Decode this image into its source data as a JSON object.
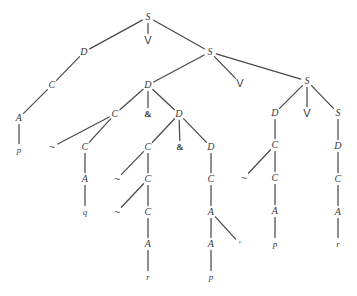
{
  "figure": {
    "kind": "syntax-tree",
    "width": 357,
    "height": 296,
    "background": "#ffffff",
    "stroke_color": "#4a4a4a",
    "text_color": "#3a3a3a"
  },
  "nodes": [
    {
      "id": "n0",
      "label": "S",
      "x": 148,
      "y": 17,
      "class": ""
    },
    {
      "id": "n1",
      "label": "D",
      "x": 84,
      "y": 52,
      "class": ""
    },
    {
      "id": "n2",
      "label": "V",
      "x": 148,
      "y": 40,
      "class": "conn"
    },
    {
      "id": "n3",
      "label": "S",
      "x": 210,
      "y": 52,
      "class": ""
    },
    {
      "id": "n4",
      "label": "C",
      "x": 52,
      "y": 85,
      "class": ""
    },
    {
      "id": "n5",
      "label": "A",
      "x": 19,
      "y": 118,
      "class": ""
    },
    {
      "id": "n6",
      "label": "p",
      "x": 19,
      "y": 150,
      "class": "terminal"
    },
    {
      "id": "n7",
      "label": "D",
      "x": 148,
      "y": 85,
      "class": ""
    },
    {
      "id": "n8",
      "label": "V",
      "x": 240,
      "y": 83,
      "class": "conn"
    },
    {
      "id": "n9",
      "label": "S",
      "x": 307,
      "y": 81,
      "class": ""
    },
    {
      "id": "n10",
      "label": "C",
      "x": 115,
      "y": 114,
      "class": ""
    },
    {
      "id": "n11",
      "label": "&",
      "x": 148,
      "y": 114,
      "class": "op"
    },
    {
      "id": "n12",
      "label": "D",
      "x": 179,
      "y": 114,
      "class": ""
    },
    {
      "id": "n13",
      "label": "~",
      "x": 52,
      "y": 147,
      "class": "tilde"
    },
    {
      "id": "n14",
      "label": "C",
      "x": 85,
      "y": 147,
      "class": ""
    },
    {
      "id": "n15",
      "label": "A",
      "x": 85,
      "y": 179,
      "class": ""
    },
    {
      "id": "n16",
      "label": "q",
      "x": 85,
      "y": 212,
      "class": "terminal"
    },
    {
      "id": "n17",
      "label": "C",
      "x": 148,
      "y": 147,
      "class": ""
    },
    {
      "id": "n18",
      "label": "&",
      "x": 180,
      "y": 147,
      "class": "op"
    },
    {
      "id": "n19",
      "label": "D",
      "x": 211,
      "y": 147,
      "class": ""
    },
    {
      "id": "n20",
      "label": "~",
      "x": 117,
      "y": 179,
      "class": "tilde"
    },
    {
      "id": "n21",
      "label": "C",
      "x": 148,
      "y": 179,
      "class": ""
    },
    {
      "id": "n22",
      "label": "~",
      "x": 117,
      "y": 212,
      "class": "tilde"
    },
    {
      "id": "n23",
      "label": "C",
      "x": 148,
      "y": 212,
      "class": ""
    },
    {
      "id": "n24",
      "label": "A",
      "x": 148,
      "y": 244,
      "class": ""
    },
    {
      "id": "n25",
      "label": "r",
      "x": 148,
      "y": 277,
      "class": "terminal"
    },
    {
      "id": "n26",
      "label": "C",
      "x": 211,
      "y": 179,
      "class": ""
    },
    {
      "id": "n27",
      "label": "A",
      "x": 211,
      "y": 212,
      "class": ""
    },
    {
      "id": "n28",
      "label": "A",
      "x": 211,
      "y": 244,
      "class": ""
    },
    {
      "id": "n29",
      "label": "′",
      "x": 240,
      "y": 244,
      "class": "prime"
    },
    {
      "id": "n30",
      "label": "p",
      "x": 211,
      "y": 277,
      "class": "terminal"
    },
    {
      "id": "n31",
      "label": "D",
      "x": 275,
      "y": 113,
      "class": ""
    },
    {
      "id": "n32",
      "label": "V",
      "x": 307,
      "y": 113,
      "class": "conn"
    },
    {
      "id": "n33",
      "label": "S",
      "x": 338,
      "y": 113,
      "class": ""
    },
    {
      "id": "n34",
      "label": "C",
      "x": 275,
      "y": 145,
      "class": ""
    },
    {
      "id": "n35",
      "label": "~",
      "x": 244,
      "y": 178,
      "class": "tilde"
    },
    {
      "id": "n36",
      "label": "C",
      "x": 275,
      "y": 178,
      "class": ""
    },
    {
      "id": "n37",
      "label": "A",
      "x": 275,
      "y": 211,
      "class": ""
    },
    {
      "id": "n38",
      "label": "p",
      "x": 275,
      "y": 244,
      "class": "terminal"
    },
    {
      "id": "n39",
      "label": "D",
      "x": 338,
      "y": 146,
      "class": ""
    },
    {
      "id": "n40",
      "label": "C",
      "x": 338,
      "y": 179,
      "class": ""
    },
    {
      "id": "n41",
      "label": "A",
      "x": 338,
      "y": 212,
      "class": ""
    },
    {
      "id": "n42",
      "label": "r",
      "x": 338,
      "y": 244,
      "class": "terminal"
    }
  ],
  "edges": [
    {
      "from": "n0",
      "to": "n1"
    },
    {
      "from": "n0",
      "to": "n2"
    },
    {
      "from": "n0",
      "to": "n3"
    },
    {
      "from": "n1",
      "to": "n4"
    },
    {
      "from": "n4",
      "to": "n5"
    },
    {
      "from": "n5",
      "to": "n6"
    },
    {
      "from": "n3",
      "to": "n7"
    },
    {
      "from": "n3",
      "to": "n8"
    },
    {
      "from": "n3",
      "to": "n9"
    },
    {
      "from": "n7",
      "to": "n10"
    },
    {
      "from": "n7",
      "to": "n11"
    },
    {
      "from": "n7",
      "to": "n12"
    },
    {
      "from": "n10",
      "to": "n13"
    },
    {
      "from": "n10",
      "to": "n14"
    },
    {
      "from": "n14",
      "to": "n15"
    },
    {
      "from": "n15",
      "to": "n16"
    },
    {
      "from": "n12",
      "to": "n17"
    },
    {
      "from": "n12",
      "to": "n18"
    },
    {
      "from": "n12",
      "to": "n19"
    },
    {
      "from": "n17",
      "to": "n20"
    },
    {
      "from": "n17",
      "to": "n21"
    },
    {
      "from": "n21",
      "to": "n22"
    },
    {
      "from": "n21",
      "to": "n23"
    },
    {
      "from": "n23",
      "to": "n24"
    },
    {
      "from": "n24",
      "to": "n25"
    },
    {
      "from": "n19",
      "to": "n26"
    },
    {
      "from": "n26",
      "to": "n27"
    },
    {
      "from": "n27",
      "to": "n28"
    },
    {
      "from": "n27",
      "to": "n29"
    },
    {
      "from": "n28",
      "to": "n30"
    },
    {
      "from": "n9",
      "to": "n31"
    },
    {
      "from": "n9",
      "to": "n32"
    },
    {
      "from": "n9",
      "to": "n33"
    },
    {
      "from": "n31",
      "to": "n34"
    },
    {
      "from": "n34",
      "to": "n35"
    },
    {
      "from": "n34",
      "to": "n36"
    },
    {
      "from": "n36",
      "to": "n37"
    },
    {
      "from": "n37",
      "to": "n38"
    },
    {
      "from": "n33",
      "to": "n39"
    },
    {
      "from": "n39",
      "to": "n40"
    },
    {
      "from": "n40",
      "to": "n41"
    },
    {
      "from": "n41",
      "to": "n42"
    }
  ]
}
